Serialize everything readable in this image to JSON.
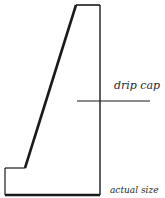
{
  "diagram": {
    "type": "profile-section",
    "labels": {
      "drip_cap": "drip cap",
      "scale": "actual size"
    },
    "colors": {
      "stroke": "#1a1a1a",
      "background": "#ffffff"
    }
  }
}
